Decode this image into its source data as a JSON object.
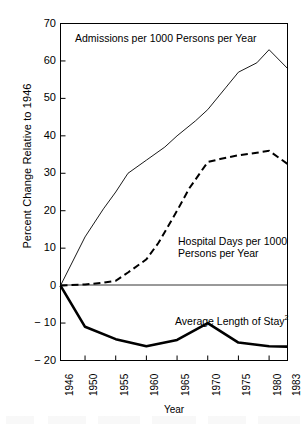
{
  "chart_data": {
    "type": "line",
    "title": "",
    "xlabel": "Year",
    "ylabel": "Percent Change Relative to 1946",
    "xlim": [
      1946,
      1983
    ],
    "ylim": [
      -20,
      70
    ],
    "yticks": [
      70,
      60,
      50,
      40,
      30,
      20,
      10,
      0,
      -10,
      -20
    ],
    "ytick_labels": [
      "70",
      "60",
      "50",
      "40",
      "30",
      "20",
      "10",
      "0",
      "− 10",
      "− 20"
    ],
    "xticks": [
      1946,
      1950,
      1955,
      1960,
      1965,
      1970,
      1975,
      1980,
      1983
    ],
    "xtick_labels": [
      "1946",
      "1950",
      "1955",
      "1960",
      "1965",
      "1970",
      "1975",
      "1980",
      "1983"
    ],
    "grid": false,
    "legend_position": "inline-annotations",
    "series": [
      {
        "name": "Admissions per 1000 Persons per Year",
        "style": "thin-solid",
        "color": "#000000",
        "x": [
          1946,
          1950,
          1953,
          1955,
          1957,
          1960,
          1963,
          1965,
          1968,
          1970,
          1973,
          1975,
          1978,
          1980,
          1983
        ],
        "values": [
          0,
          13,
          20.5,
          25,
          30,
          33.5,
          37,
          40,
          44,
          47,
          53,
          57,
          59.5,
          63,
          58
        ]
      },
      {
        "name": "Hospital Days per 1000 Persons per Year",
        "style": "dashed",
        "color": "#000000",
        "x": [
          1946,
          1950,
          1953,
          1955,
          1957,
          1960,
          1962,
          1965,
          1967,
          1970,
          1972,
          1975,
          1978,
          1980,
          1983
        ],
        "values": [
          0,
          0.3,
          0.8,
          1.3,
          3.5,
          7,
          11.5,
          20,
          26,
          33,
          33.8,
          34.8,
          35.5,
          36,
          32.5
        ]
      },
      {
        "name": "Average Length of Stay",
        "style": "thick-solid",
        "color": "#000000",
        "x": [
          1946,
          1950,
          1955,
          1960,
          1965,
          1970,
          1975,
          1980,
          1983
        ],
        "values": [
          0,
          -11,
          -14.3,
          -16.2,
          -14.5,
          -10,
          -15.2,
          -16.2,
          -16.3
        ]
      }
    ],
    "annotations": [
      {
        "id": "annotation-admissions",
        "text": "Admissions per 1000 Persons per Year",
        "x_px": 75,
        "y_px": 32
      },
      {
        "id": "annotation-hospital-days-line1",
        "text": "Hospital Days per 1000",
        "x_px": 178,
        "y_px": 235
      },
      {
        "id": "annotation-hospital-days-line2",
        "text": "Persons per Year",
        "x_px": 178,
        "y_px": 247
      },
      {
        "id": "annotation-average-length-of-stay",
        "text": "Average Length of Stay",
        "superscript": "2",
        "x_px": 175,
        "y_px": 312
      }
    ]
  },
  "axes": {
    "y_axis_title": "Percent Change Relative to 1946",
    "x_axis_title": "Year"
  }
}
